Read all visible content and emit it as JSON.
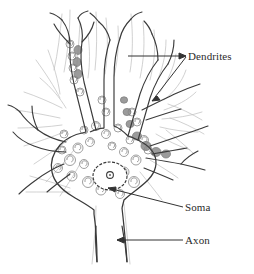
{
  "figure": {
    "type": "labeled-line-drawing",
    "background_color": "#ffffff",
    "ink_color": "#3a3a3a",
    "granule_color": "#a9a9a9",
    "label_color": "#2b2b2b",
    "leader_color": "#333333"
  },
  "labels": {
    "dendrites": "Dendrites",
    "soma": "Soma",
    "axon": "Axon"
  },
  "structures": {
    "cell_body": "soma",
    "nucleus": "nucleus",
    "nucleolus": "nucleolus",
    "processes": "dendritic-branches",
    "output_fiber": "axon",
    "granules": "nissl-bodies"
  },
  "leaders": {
    "dendrites_upper": "leader-line-dendrites-upper",
    "dendrites_lower": "leader-line-dendrites-lower",
    "soma": "leader-line-soma",
    "axon": "leader-line-axon"
  }
}
